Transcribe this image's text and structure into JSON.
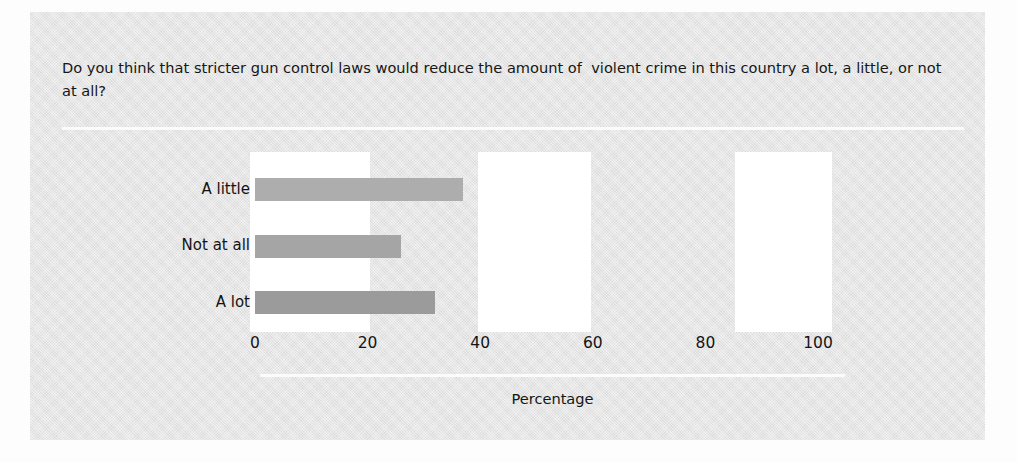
{
  "figure": {
    "question": "Do you think that stricter gun control laws would reduce the amount of  violent crime in this country a lot, a little, or not at all?",
    "panel_color": "#e2e2e2",
    "page_color": "#fdfdfd",
    "rule_color": "#fbfbfb"
  },
  "chart_data": {
    "type": "bar",
    "orientation": "horizontal",
    "title": "Do you think that stricter gun control laws would reduce the amount of  violent crime in this country a lot, a little, or not at all?",
    "categories": [
      "A little",
      "Not at all",
      "A lot"
    ],
    "values": [
      37,
      26,
      32
    ],
    "xlabel": "Percentage",
    "ylabel": "",
    "xlim": [
      0,
      100
    ],
    "xticks": [
      0,
      20,
      40,
      60,
      80,
      100
    ],
    "xtick_labels": [
      "0",
      "20",
      "40",
      "60",
      "80",
      "100"
    ],
    "grid": false,
    "legend": null,
    "bar_colors": [
      "#adadad",
      "#a5a5a5",
      "#9b9b9b"
    ],
    "series": [
      {
        "name": "Percentage",
        "points": [
          {
            "category": "A little",
            "value": 37
          },
          {
            "category": "Not at all",
            "value": 26
          },
          {
            "category": "A lot",
            "value": 32
          }
        ]
      }
    ]
  },
  "axis": {
    "ticks": [
      {
        "label": "0",
        "value": 0
      },
      {
        "label": "20",
        "value": 20
      },
      {
        "label": "40",
        "value": 40
      },
      {
        "label": "60",
        "value": 60
      },
      {
        "label": "80",
        "value": 80
      },
      {
        "label": "100",
        "value": 100
      }
    ],
    "title": "Percentage"
  },
  "categories": [
    {
      "label": "A little",
      "value": 37,
      "color": "#adadad"
    },
    {
      "label": "Not at all",
      "value": 26,
      "color": "#a5a5a5"
    },
    {
      "label": "A lot",
      "value": 32,
      "color": "#9b9b9b"
    }
  ],
  "artifacts": [
    {
      "name": "scan-block-left",
      "x": 220,
      "y": 140,
      "w": 120,
      "h": 180
    },
    {
      "name": "scan-block-middle",
      "x": 448,
      "y": 140,
      "w": 113,
      "h": 180
    },
    {
      "name": "scan-block-right",
      "x": 705,
      "y": 140,
      "w": 97,
      "h": 180
    }
  ]
}
